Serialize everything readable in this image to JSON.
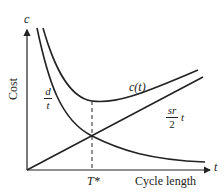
{
  "diagram": {
    "y_axis_symbol": "c",
    "y_axis_label": "Cost",
    "x_axis_symbol": "t",
    "x_axis_label": "Cycle length",
    "optimum_label": "T*",
    "curves": [
      {
        "name": "total-cost",
        "label": "c(t)"
      },
      {
        "name": "ordering-cost",
        "label_num": "d",
        "label_den": "t"
      },
      {
        "name": "holding-cost",
        "label_num": "sr",
        "label_den": "2",
        "label_var": "t"
      }
    ],
    "colors": {
      "line": "#222222",
      "background": "#ffffff"
    }
  }
}
